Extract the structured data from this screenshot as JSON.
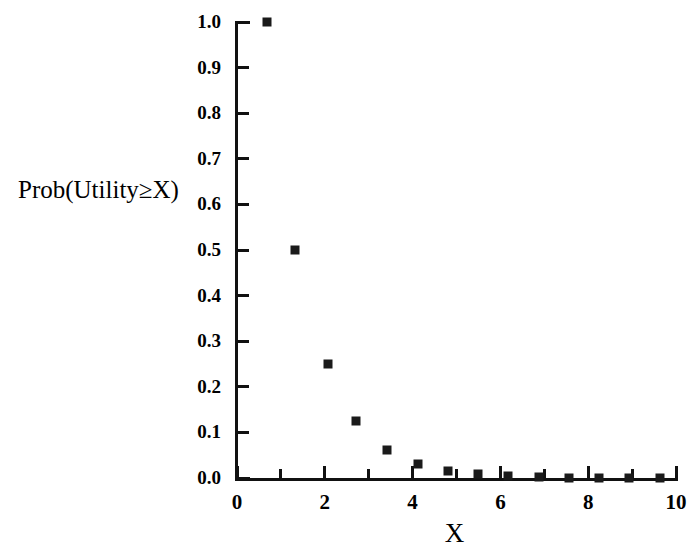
{
  "chart_data": {
    "type": "scatter",
    "title": "",
    "xlabel": "X",
    "ylabel": "Prob(Utility≥X)",
    "xlim": [
      0,
      10
    ],
    "ylim": [
      0.0,
      1.0
    ],
    "grid": false,
    "legend": null,
    "marker": "filled-square",
    "marker_color": "#1a1a1a",
    "x_ticks": [
      0,
      2,
      4,
      6,
      8,
      10
    ],
    "x_tick_labels": [
      "0",
      "2",
      "4",
      "6",
      "8",
      "10"
    ],
    "x_minor_ticks": [
      1,
      3,
      5,
      7,
      9
    ],
    "y_ticks": [
      0.0,
      0.1,
      0.2,
      0.3,
      0.4,
      0.5,
      0.6,
      0.7,
      0.8,
      0.9,
      1.0
    ],
    "y_tick_labels": [
      "0.0",
      "0.1",
      "0.2",
      "0.3",
      "0.4",
      "0.5",
      "0.6",
      "0.7",
      "0.8",
      "0.9",
      "1.0"
    ],
    "x": [
      0.68,
      1.32,
      2.07,
      2.71,
      3.42,
      4.12,
      4.8,
      5.49,
      6.18,
      6.87,
      7.56,
      8.25,
      8.94,
      9.63
    ],
    "y": [
      1.0,
      0.5,
      0.25,
      0.125,
      0.0625,
      0.031,
      0.016,
      0.008,
      0.004,
      0.002,
      0.001,
      0.0005,
      0.0003,
      0.0001
    ],
    "points": [
      {
        "x": 0.68,
        "y": 1.0
      },
      {
        "x": 1.32,
        "y": 0.5
      },
      {
        "x": 2.07,
        "y": 0.25
      },
      {
        "x": 2.71,
        "y": 0.125
      },
      {
        "x": 3.42,
        "y": 0.0625
      },
      {
        "x": 4.12,
        "y": 0.031
      },
      {
        "x": 4.8,
        "y": 0.016
      },
      {
        "x": 5.49,
        "y": 0.008
      },
      {
        "x": 6.18,
        "y": 0.004
      },
      {
        "x": 6.87,
        "y": 0.002
      },
      {
        "x": 7.56,
        "y": 0.001
      },
      {
        "x": 8.25,
        "y": 0.0005
      },
      {
        "x": 8.94,
        "y": 0.0003
      },
      {
        "x": 9.63,
        "y": 0.0001
      }
    ],
    "axis_color": "#111111"
  }
}
